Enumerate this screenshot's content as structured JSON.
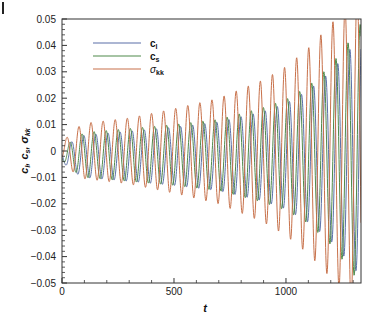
{
  "chart_data": {
    "type": "line",
    "title": "",
    "xlabel": "t",
    "ylabel": "c_l, c_s, σ_kk",
    "xlim": [
      0,
      1335
    ],
    "ylim": [
      -0.05,
      0.05
    ],
    "x_ticks": [
      0,
      500,
      1000
    ],
    "x_tick_labels": [
      "0",
      "500",
      "1000"
    ],
    "y_ticks": [
      0.05,
      0.04,
      0.03,
      0.02,
      0.01,
      0,
      -0.01,
      -0.02,
      -0.03,
      -0.04,
      -0.05
    ],
    "y_tick_labels": [
      "0.05",
      "0.04",
      "0.03",
      "0.02",
      "0.01",
      "0",
      "-0.01",
      "-0.02",
      "-0.03",
      "-0.04",
      "-0.05"
    ],
    "grid": false,
    "legend_position": "upper-left",
    "period": 54,
    "series": [
      {
        "name": "c_l",
        "label_main": "c",
        "label_sub": "l",
        "color": "#5a6fa8",
        "phase": 0.55,
        "offset": -0.002,
        "envelope_t": [
          0,
          50,
          100,
          300,
          500,
          700,
          900,
          1000,
          1100,
          1200,
          1300,
          1335
        ],
        "envelope_amp": [
          0.002,
          0.006,
          0.008,
          0.0095,
          0.011,
          0.013,
          0.017,
          0.02,
          0.025,
          0.032,
          0.042,
          0.046
        ]
      },
      {
        "name": "c_s",
        "label_main": "c",
        "label_sub": "s",
        "color": "#4f8a4a",
        "phase": 0.4,
        "offset": -0.0015,
        "envelope_t": [
          0,
          50,
          100,
          300,
          500,
          700,
          900,
          1000,
          1100,
          1200,
          1300,
          1335
        ],
        "envelope_amp": [
          0.002,
          0.006,
          0.0085,
          0.01,
          0.0115,
          0.0135,
          0.018,
          0.021,
          0.026,
          0.034,
          0.045,
          0.05
        ]
      },
      {
        "name": "σ_kk",
        "label_main": "σ",
        "label_sub": "kk",
        "color": "#c8714a",
        "phase": 0.15,
        "offset": 0.0,
        "envelope_t": [
          0,
          50,
          100,
          300,
          500,
          700,
          900,
          1000,
          1100,
          1200,
          1300,
          1335
        ],
        "envelope_amp": [
          0.003,
          0.008,
          0.0105,
          0.0125,
          0.016,
          0.02,
          0.027,
          0.032,
          0.039,
          0.048,
          0.058,
          0.062
        ]
      }
    ]
  }
}
